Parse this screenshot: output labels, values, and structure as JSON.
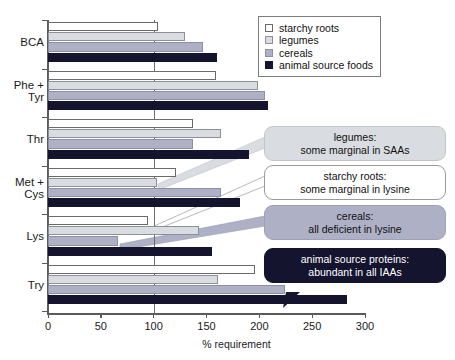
{
  "chart_data": {
    "type": "bar",
    "orientation": "horizontal",
    "title": "",
    "xlabel": "% requirement",
    "ylabel": "",
    "xlim": [
      0,
      300
    ],
    "xticks": [
      0,
      50,
      100,
      150,
      200,
      250,
      300
    ],
    "grid": false,
    "reference_line": 100,
    "legend_position": "top-right",
    "categories": [
      "BCA",
      "Phe +\nTyr",
      "Thr",
      "Met +\nCys",
      "Lys",
      "Try"
    ],
    "category_labels": [
      [
        "BCA"
      ],
      [
        "Phe +",
        "Tyr"
      ],
      [
        "Thr"
      ],
      [
        "Met +",
        "Cys"
      ],
      [
        "Lys"
      ],
      [
        "Try"
      ]
    ],
    "series": [
      {
        "name": "starchy roots",
        "color": "#ffffff",
        "values": [
          104,
          159,
          137,
          121,
          95,
          196
        ]
      },
      {
        "name": "legumes",
        "color": "#d9dde1",
        "values": [
          130,
          199,
          164,
          103,
          143,
          161
        ]
      },
      {
        "name": "cereals",
        "color": "#aeb0c6",
        "values": [
          147,
          205,
          137,
          164,
          66,
          224
        ]
      },
      {
        "name": "animal source foods",
        "color": "#14142f",
        "values": [
          160,
          208,
          190,
          182,
          155,
          283
        ]
      }
    ]
  },
  "legend": {
    "items": [
      {
        "label": "starchy roots",
        "color": "#ffffff"
      },
      {
        "label": "legumes",
        "color": "#d9dde1"
      },
      {
        "label": "cereals",
        "color": "#aeb0c6"
      },
      {
        "label": "animal source foods",
        "color": "#14142f"
      }
    ]
  },
  "annotations": [
    {
      "id": "legumes",
      "line1": "legumes:",
      "line2": "some marginal in SAAs"
    },
    {
      "id": "starchy",
      "line1": "starchy roots:",
      "line2": "some marginal in lysine"
    },
    {
      "id": "cereals",
      "line1": "cereals:",
      "line2": "all deficient in lysine"
    },
    {
      "id": "animal",
      "line1": "animal source proteins:",
      "line2": "abundant in all IAAs"
    }
  ],
  "axis": {
    "x_title": "% requirement",
    "x_ticks": [
      "0",
      "50",
      "100",
      "150",
      "200",
      "250",
      "300"
    ]
  }
}
